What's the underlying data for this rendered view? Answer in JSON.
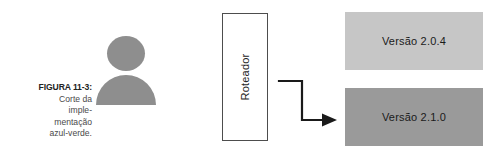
{
  "figure": {
    "caption": {
      "label": "FIGURA 11-3:",
      "lines": [
        "Corte da",
        "imple-",
        "mentação",
        "azul-verde."
      ]
    },
    "actor": {
      "icon": "user-icon",
      "color": "#8e8e8e"
    },
    "router": {
      "label": "Roteador",
      "border_color": "#4d4d4d",
      "fill_color": "#ffffff"
    },
    "connector": {
      "icon": "elbow-arrow-icon",
      "color": "#1a1a1a",
      "points_to": "Versão 2.1.0"
    },
    "versions": [
      {
        "label": "Versão 2.0.4",
        "color": "#c6c6c6"
      },
      {
        "label": "Versão 2.1.0",
        "color": "#9a9a9a"
      }
    ]
  }
}
